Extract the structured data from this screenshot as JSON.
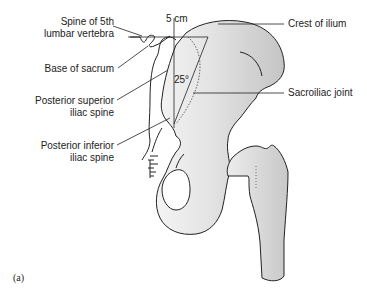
{
  "figure": {
    "caption": "(a)",
    "measurement": "5 cm",
    "angle": "25°",
    "labels_left": [
      {
        "line1": "Spine of 5th",
        "line2": "lumbar vertebra"
      },
      {
        "line1": "Base of sacrum",
        "line2": ""
      },
      {
        "line1": "Posterior superior",
        "line2": "iliac spine"
      },
      {
        "line1": "Posterior inferior",
        "line2": "iliac spine"
      }
    ],
    "labels_right": [
      {
        "text": "Crest of ilium"
      },
      {
        "text": "Sacroiliac joint"
      }
    ],
    "colors": {
      "outline": "#222222",
      "bone_fill_light": "#efefef",
      "bone_fill_dark": "#c8c8c8",
      "text": "#222222"
    }
  }
}
